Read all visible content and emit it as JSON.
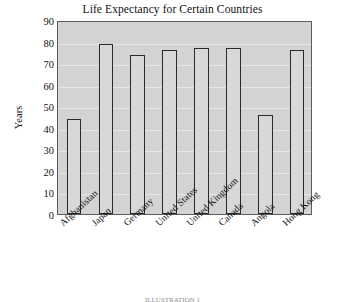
{
  "chart_data": {
    "type": "bar",
    "title": "Life Expectancy for Certain Countries",
    "xlabel": "",
    "ylabel": "Years",
    "ylim": [
      0,
      90
    ],
    "ytick_step": 10,
    "yticks": [
      90,
      80,
      70,
      60,
      50,
      40,
      30,
      20,
      10,
      0
    ],
    "grid": true,
    "legend": "none",
    "categories": [
      "Afghanistan",
      "Japan",
      "Germany",
      "United States",
      "United Kingdom",
      "Canada",
      "Angola",
      "Hong Kong"
    ],
    "values": [
      44,
      79,
      74,
      76,
      77,
      77,
      46,
      76
    ],
    "bar_fill_color": "#d8d8d8",
    "bar_edge_color": "#2a2a2a",
    "plot_background_color": "#d3d3d3",
    "gridline_color": "#ececec",
    "figure_background_color": "#ffffff"
  },
  "caption": {
    "clipped_text": "ILLUSTRATION 1"
  }
}
